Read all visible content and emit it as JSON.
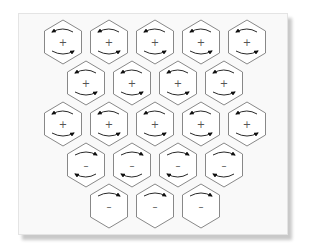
{
  "diagram": {
    "type": "hexagonal-cell-array",
    "colors": {
      "background": "#f9f9f9",
      "hex_stroke": "#7a7a7a",
      "hex_fill": "#ffffff",
      "bead_stroke": "#9a9a9a",
      "arrow": "#111111",
      "sign": "#555555"
    },
    "rows": [
      {
        "y": 42,
        "cells": [
          {
            "x": 63,
            "sign": "+",
            "rotation": "ccw"
          },
          {
            "x": 109,
            "sign": "+",
            "rotation": "ccw"
          },
          {
            "x": 155,
            "sign": "+",
            "rotation": "ccw"
          },
          {
            "x": 201,
            "sign": "+",
            "rotation": "ccw"
          },
          {
            "x": 247,
            "sign": "+",
            "rotation": "ccw"
          }
        ]
      },
      {
        "y": 83,
        "cells": [
          {
            "x": 86,
            "sign": "+",
            "rotation": "ccw"
          },
          {
            "x": 132,
            "sign": "+",
            "rotation": "ccw"
          },
          {
            "x": 178,
            "sign": "+",
            "rotation": "ccw"
          },
          {
            "x": 224,
            "sign": "+",
            "rotation": "ccw"
          }
        ]
      },
      {
        "y": 124,
        "cells": [
          {
            "x": 63,
            "sign": "+",
            "rotation": "ccw"
          },
          {
            "x": 109,
            "sign": "+",
            "rotation": "ccw"
          },
          {
            "x": 155,
            "sign": "+",
            "rotation": "ccw"
          },
          {
            "x": 201,
            "sign": "+",
            "rotation": "ccw"
          },
          {
            "x": 247,
            "sign": "+",
            "rotation": "ccw"
          }
        ]
      },
      {
        "y": 165,
        "cells": [
          {
            "x": 86,
            "sign": "–",
            "rotation": "cw"
          },
          {
            "x": 132,
            "sign": "–",
            "rotation": "cw"
          },
          {
            "x": 178,
            "sign": "–",
            "rotation": "cw"
          },
          {
            "x": 224,
            "sign": "–",
            "rotation": "cw"
          }
        ]
      },
      {
        "y": 206,
        "cells": [
          {
            "x": 109,
            "sign": "–",
            "rotation": "cw-top-only"
          },
          {
            "x": 155,
            "sign": "–",
            "rotation": "cw-top-only"
          },
          {
            "x": 201,
            "sign": "–",
            "rotation": "cw-top-only"
          }
        ]
      }
    ]
  }
}
